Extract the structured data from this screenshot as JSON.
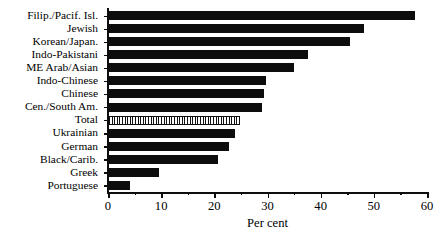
{
  "chart_data": {
    "type": "bar",
    "orientation": "horizontal",
    "title": "",
    "subtitle": "",
    "xlabel": "Per cent",
    "ylabel": "",
    "xlim": [
      0,
      60
    ],
    "ylim": null,
    "grid": false,
    "legend": null,
    "xticks": [
      0,
      10,
      20,
      30,
      40,
      50,
      60
    ],
    "xtick_labels": [
      "0",
      "10",
      "20",
      "30",
      "40",
      "50",
      "60"
    ],
    "xminor_ticks": [
      5,
      15,
      25,
      35,
      45,
      55
    ],
    "categories": [
      "Filip./Pacif. Isl.",
      "Jewish",
      "Korean/Japan.",
      "Indo-Pakistani",
      "ME Arab/Asian",
      "Indo-Chinese",
      "Chinese",
      "Cen./South Am.",
      "Total",
      "Ukrainian",
      "German",
      "Black/Carib.",
      "Greek",
      "Portuguese"
    ],
    "values": [
      57.7,
      48.1,
      45.5,
      37.6,
      34.9,
      29.7,
      29.3,
      28.9,
      24.8,
      23.9,
      22.8,
      20.7,
      9.6,
      4.1
    ],
    "highlight_category": "Total",
    "bar_color": "#0d0d0d",
    "highlight_fill": "hatched-vertical-lines",
    "highlight_edge_color": "#0d0d0d",
    "background_color": "#ffffff"
  }
}
